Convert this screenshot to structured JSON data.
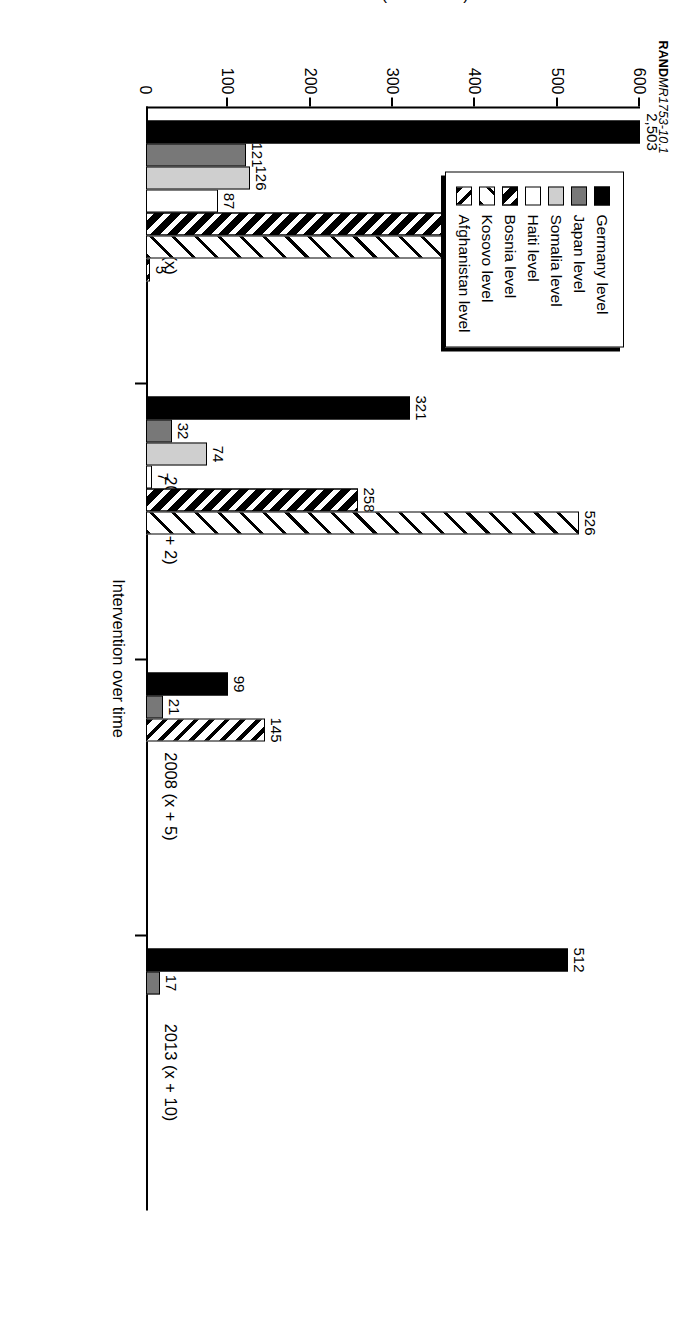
{
  "figure": {
    "id_bold": "RAND",
    "id_italic": "MR1753-10.1"
  },
  "legend": {
    "items": [
      {
        "label": "Germany level",
        "swatch": "solid-black-swatch",
        "fill": "f-solidblack"
      },
      {
        "label": "Japan level",
        "swatch": "medium-gray-swatch",
        "fill": "f-midgray"
      },
      {
        "label": "Somalia level",
        "swatch": "light-gray-swatch",
        "fill": "f-lightgray"
      },
      {
        "label": "Haiti level",
        "swatch": "white-swatch",
        "fill": "f-white"
      },
      {
        "label": "Bosnia level",
        "swatch": "black-hatch-swatch",
        "fill": "f-bosnia"
      },
      {
        "label": "Kosovo level",
        "swatch": "sparse-hatch-swatch",
        "fill": "f-kosovo"
      },
      {
        "label": "Afghanistan level",
        "swatch": "dense-hatch-swatch",
        "fill": "f-afghan"
      }
    ]
  },
  "chart_data": {
    "type": "bar",
    "title": "",
    "xlabel": "Intervention over time",
    "ylabel": "Soldiers (thousands)",
    "ylim": [
      0,
      600
    ],
    "yticks": [
      0,
      100,
      200,
      300,
      400,
      500,
      600
    ],
    "ytick_labels": [
      "0",
      "100",
      "200",
      "300",
      "400",
      "500",
      "600"
    ],
    "grid": false,
    "legend_position": "top-left-inside",
    "categories": [
      "2003 (x)",
      "2005 (x + 2)",
      "2008 (x + 5)",
      "2013 (x + 10)"
    ],
    "series": [
      {
        "name": "Germany level",
        "fill": "f-solidblack",
        "values": [
          2503,
          321,
          99,
          512
        ],
        "labels": [
          "2,503",
          "321",
          "99",
          "512"
        ]
      },
      {
        "name": "Japan level",
        "fill": "f-midgray",
        "values": [
          121,
          32,
          21,
          17
        ],
        "labels": [
          "121",
          "32",
          "21",
          "17"
        ]
      },
      {
        "name": "Somalia level",
        "fill": "f-lightgray",
        "values": [
          126,
          74,
          null,
          null
        ],
        "labels": [
          "126",
          "74",
          "",
          ""
        ]
      },
      {
        "name": "Haiti level",
        "fill": "f-white",
        "values": [
          87,
          7,
          null,
          null
        ],
        "labels": [
          "87",
          "7",
          "",
          ""
        ]
      },
      {
        "name": "Bosnia level",
        "fill": "f-bosnia",
        "values": [
          460,
          258,
          null,
          null
        ],
        "labels": [
          "460",
          "258",
          "",
          ""
        ]
      },
      {
        "name": "Kosovo level",
        "fill": "f-kosovo",
        "values": [
          494,
          526,
          null,
          null
        ],
        "labels": [
          "494",
          "526",
          "",
          ""
        ]
      },
      {
        "name": "Afghanistan level",
        "fill": "f-afghan",
        "values": [
          5,
          null,
          145,
          null
        ],
        "labels": [
          "5",
          "",
          "145",
          ""
        ]
      }
    ]
  }
}
